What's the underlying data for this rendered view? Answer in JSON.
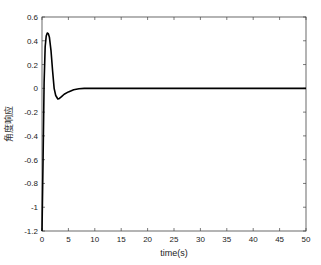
{
  "chart_data": {
    "type": "line",
    "title": "",
    "xlabel": "time(s)",
    "ylabel": "角度响应",
    "xlim": [
      0,
      50
    ],
    "ylim": [
      -1.2,
      0.6
    ],
    "xticks": [
      0,
      5,
      10,
      15,
      20,
      25,
      30,
      35,
      40,
      45,
      50
    ],
    "yticks": [
      0.6,
      0.4,
      0.2,
      0,
      -0.2,
      -0.4,
      -0.6,
      -0.8,
      -1,
      -1.2
    ],
    "xtick_labels": [
      "0",
      "5",
      "10",
      "15",
      "20",
      "25",
      "30",
      "35",
      "40",
      "45",
      "50"
    ],
    "ytick_labels": [
      "0.6",
      "0.4",
      "0.2",
      "0",
      "-0.2",
      "-0.4",
      "-0.6",
      "-0.8",
      "-1",
      "-1.2"
    ],
    "grid": false,
    "legend": null,
    "series": [
      {
        "name": "angle response",
        "color": "#000000",
        "x": [
          0,
          0.2,
          0.4,
          0.6,
          0.8,
          1.0,
          1.2,
          1.4,
          1.7,
          2.0,
          2.3,
          2.6,
          3.0,
          3.3,
          3.7,
          4.2,
          5.0,
          6.0,
          7.0,
          8.0,
          10,
          15,
          20,
          30,
          40,
          50
        ],
        "values": [
          -1.2,
          -0.6,
          0.05,
          0.35,
          0.44,
          0.465,
          0.46,
          0.43,
          0.32,
          0.15,
          0.0,
          -0.06,
          -0.09,
          -0.085,
          -0.07,
          -0.05,
          -0.03,
          -0.012,
          -0.004,
          0.0,
          0.0,
          0.0,
          0.0,
          0.0,
          0.0,
          0.0
        ]
      }
    ]
  },
  "plot": {
    "left": 42,
    "right": 306,
    "top": 17,
    "bottom": 231
  }
}
